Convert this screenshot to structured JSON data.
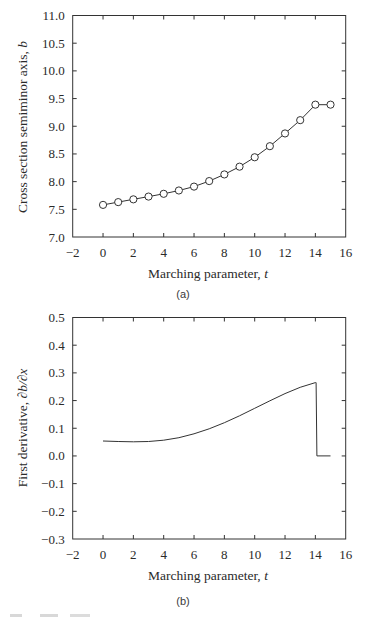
{
  "chart_data": [
    {
      "panel": "(a)",
      "type": "line",
      "title": "",
      "xlabel": "Marching parameter, t",
      "ylabel": "Cross section semiminor axis, b",
      "xlim": [
        -2,
        16
      ],
      "ylim": [
        7.0,
        11.0
      ],
      "xticks": [
        "-2",
        "0",
        "2",
        "4",
        "6",
        "8",
        "10",
        "12",
        "14",
        "16"
      ],
      "yticks": [
        "7.0",
        "7.5",
        "8.0",
        "8.5",
        "9.0",
        "9.5",
        "10.0",
        "10.5",
        "11.0"
      ],
      "grid": false,
      "markers": "open-circle",
      "x": [
        0,
        1,
        2,
        3,
        4,
        5,
        6,
        7,
        8,
        9,
        10,
        11,
        12,
        13,
        14,
        15
      ],
      "values": [
        7.58,
        7.63,
        7.68,
        7.73,
        7.78,
        7.84,
        7.91,
        8.01,
        8.13,
        8.27,
        8.44,
        8.64,
        8.87,
        9.11,
        9.39,
        9.39
      ]
    },
    {
      "panel": "(b)",
      "type": "line",
      "title": "",
      "xlabel": "Marching parameter, t",
      "ylabel": "First derivative, ∂b/∂x",
      "xlim": [
        -2,
        16
      ],
      "ylim": [
        -0.3,
        0.5
      ],
      "xticks": [
        "-2",
        "0",
        "2",
        "4",
        "6",
        "8",
        "10",
        "12",
        "14",
        "16"
      ],
      "yticks": [
        "-0.3",
        "-0.2",
        "-0.1",
        "0.0",
        "0.1",
        "0.2",
        "0.3",
        "0.4",
        "0.5"
      ],
      "grid": false,
      "markers": "none",
      "x": [
        0,
        1,
        2,
        3,
        4,
        5,
        6,
        7,
        8,
        9,
        10,
        11,
        12,
        13,
        14,
        14.05,
        14.1,
        15
      ],
      "values": [
        0.054,
        0.052,
        0.051,
        0.052,
        0.057,
        0.066,
        0.08,
        0.098,
        0.12,
        0.145,
        0.172,
        0.199,
        0.225,
        0.248,
        0.265,
        0.265,
        0.0,
        0.0
      ]
    }
  ],
  "panels": {
    "a": {
      "ylabel": "Cross section semiminor axis, b",
      "xlabel_text": "Marching parameter, ",
      "xlabel_var": "t",
      "ylabel_text": "Cross section semiminor axis, ",
      "ylabel_var": "b",
      "caption": "(a)"
    },
    "b": {
      "xlabel_text": "Marching parameter, ",
      "xlabel_var": "t",
      "ylabel_text": "First derivative, ",
      "ylabel_var": "∂b/∂x",
      "caption": "(b)"
    }
  }
}
